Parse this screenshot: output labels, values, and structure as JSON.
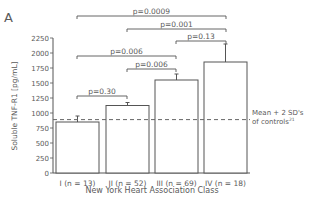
{
  "panel_label": "A",
  "chart_data": {
    "type": "bar",
    "title": "",
    "xlabel": "New York Heart Association Class",
    "ylabel": "Soluble TNF-R1 [pg/mL]",
    "ylim": [
      0,
      2250
    ],
    "yticks": [
      0,
      250,
      500,
      750,
      1000,
      1250,
      1500,
      1750,
      2000,
      2250
    ],
    "categories": [
      "I (n = 13)",
      "II (n = 52)",
      "III (n = 69)",
      "IV (n = 18)"
    ],
    "values": [
      850,
      1125,
      1550,
      1850
    ],
    "error_upper": [
      950,
      1175,
      1650,
      2150
    ],
    "reference_line": {
      "value": 890,
      "label_line1": "Mean + 2 SD's",
      "label_line2": "of controls",
      "superscript": "21",
      "style": "dashed"
    },
    "comparisons": [
      {
        "from": 0,
        "to": 3,
        "label": "p=0.0009",
        "level": 16
      },
      {
        "from": 1,
        "to": 3,
        "label": "p=0.001",
        "level": 29
      },
      {
        "from": 2,
        "to": 3,
        "label": "p=0.13",
        "level": 41
      },
      {
        "from": 0,
        "to": 2,
        "label": "p=0.006",
        "level": 56
      },
      {
        "from": 1,
        "to": 2,
        "label": "p=0.006",
        "level": 69
      },
      {
        "from": 0,
        "to": 1,
        "label": "p=0.30",
        "level": 96
      }
    ],
    "grid": false,
    "legend": "none"
  }
}
